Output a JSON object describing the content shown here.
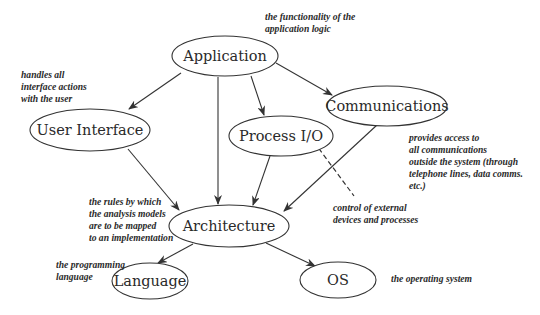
{
  "diagram": {
    "title": "",
    "nodes": {
      "application": {
        "label": "Application"
      },
      "user_interface": {
        "label": "User Interface"
      },
      "process_io": {
        "label": "Process I/O"
      },
      "communications": {
        "label": "Communications"
      },
      "architecture": {
        "label": "Architecture"
      },
      "language": {
        "label": "Language"
      },
      "os": {
        "label": "OS"
      }
    },
    "annotations": {
      "application": [
        "the functionality of the",
        "application logic"
      ],
      "user_interface": [
        "handles all",
        "interface actions",
        "with the user"
      ],
      "communications": [
        "provides access to",
        "all communications",
        "outside the system (through",
        "telephone lines, data comms.",
        "etc.)"
      ],
      "process_io": [
        "control of external",
        "devices and processes"
      ],
      "architecture": [
        "the rules by which",
        "the analysis models",
        "are to be mapped",
        "to an implementation"
      ],
      "language": [
        "the programming",
        "language"
      ],
      "os": [
        "the operating system"
      ]
    },
    "edges": [
      {
        "from": "Application",
        "to": "User Interface",
        "style": "arrow"
      },
      {
        "from": "Application",
        "to": "Architecture",
        "style": "arrow"
      },
      {
        "from": "Application",
        "to": "Process I/O",
        "style": "arrow"
      },
      {
        "from": "Application",
        "to": "Communications",
        "style": "arrow"
      },
      {
        "from": "User Interface",
        "to": "Architecture",
        "style": "arrow"
      },
      {
        "from": "Process I/O",
        "to": "Architecture",
        "style": "arrow"
      },
      {
        "from": "Communications",
        "to": "Architecture",
        "style": "arrow"
      },
      {
        "from": "Architecture",
        "to": "Language",
        "style": "arrow"
      },
      {
        "from": "Architecture",
        "to": "OS",
        "style": "arrow"
      },
      {
        "from": "Process I/O",
        "to": "control of external devices note",
        "style": "dashed"
      }
    ],
    "colors": {
      "stroke": "#333333",
      "text": "#2a2a2a",
      "background": "#ffffff"
    }
  }
}
